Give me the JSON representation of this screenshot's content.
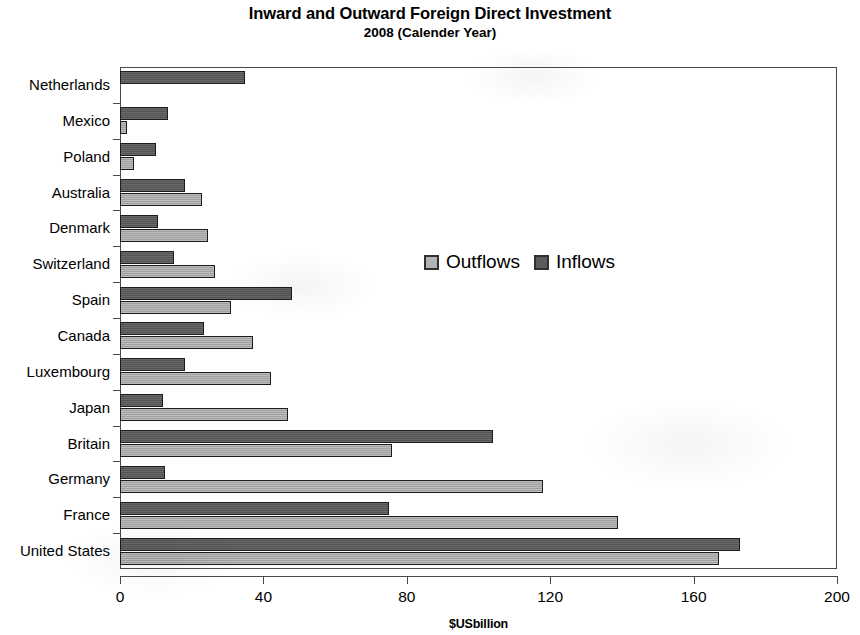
{
  "chart_data": {
    "type": "bar",
    "orientation": "horizontal",
    "title": "Inward and Outward Foreign Direct Investment",
    "subtitle": "2008 (Calender Year)",
    "xlabel": "$USbillion",
    "ylabel": "",
    "xlim": [
      0,
      200
    ],
    "xticks": [
      0,
      40,
      80,
      120,
      160,
      200
    ],
    "xtick_labels": [
      "0",
      "40",
      "80",
      "120",
      "160",
      "200"
    ],
    "grid": false,
    "legend_position": "center",
    "categories": [
      "Netherlands",
      "Mexico",
      "Poland",
      "Australia",
      "Denmark",
      "Switzerland",
      "Spain",
      "Canada",
      "Luxembourg",
      "Japan",
      "Britain",
      "Germany",
      "France",
      "United States"
    ],
    "series": [
      {
        "name": "Outflows",
        "color": "#a9a9ab",
        "values": [
          0,
          2,
          4,
          23,
          24.5,
          26.5,
          31,
          37,
          42,
          47,
          76,
          118,
          139,
          167
        ]
      },
      {
        "name": "Inflows",
        "color": "#58585a",
        "values": [
          35,
          13.5,
          10,
          18,
          10.5,
          15,
          48,
          23.5,
          18,
          12,
          104,
          12.5,
          75,
          173
        ]
      }
    ]
  }
}
